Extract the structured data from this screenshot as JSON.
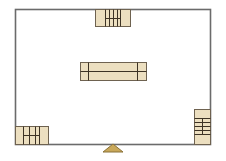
{
  "room": {
    "label": "room-outline",
    "x": 15,
    "y": 9,
    "width": 195,
    "height": 135,
    "stroke": "#6b6b6b",
    "fill": "#ffffff"
  },
  "colors": {
    "furniture_fill": "#ecdfc0",
    "furniture_stroke": "#6e6250",
    "detail_stroke": "#3d3325",
    "marker_fill": "#c9a85a",
    "marker_stroke": "#8a7238"
  },
  "furniture": [
    {
      "name": "top-shelf-unit",
      "x": 95,
      "y": 9,
      "width": 35,
      "height": 17,
      "vlines": [
        105,
        109,
        113,
        117,
        120
      ],
      "hlines": [
        {
          "y": 18,
          "x1": 105,
          "x2": 120
        }
      ]
    },
    {
      "name": "center-table",
      "x": 80,
      "y": 62,
      "width": 66,
      "height": 18,
      "vlines": [
        88,
        137
      ],
      "hlines": [
        {
          "y": 71,
          "x1": 80,
          "x2": 146
        }
      ]
    },
    {
      "name": "bottom-left-shelf-unit",
      "x": 15,
      "y": 126,
      "width": 33,
      "height": 18,
      "vlines": [
        23,
        29,
        35,
        39
      ],
      "hlines": [
        {
          "y": 135,
          "x1": 23,
          "x2": 39
        }
      ]
    },
    {
      "name": "right-shelf-unit",
      "x": 194,
      "y": 109,
      "width": 16,
      "height": 35,
      "vlines_partial": [
        {
          "x": 202,
          "y1": 118,
          "y2": 134
        }
      ],
      "hlines": [
        {
          "y": 118,
          "x1": 194,
          "x2": 210
        },
        {
          "y": 122,
          "x1": 194,
          "x2": 210
        },
        {
          "y": 126,
          "x1": 194,
          "x2": 210
        },
        {
          "y": 130,
          "x1": 194,
          "x2": 210
        },
        {
          "y": 134,
          "x1": 194,
          "x2": 210
        }
      ]
    }
  ],
  "entrance_marker": {
    "name": "entrance-marker",
    "points": [
      [
        103,
        152
      ],
      [
        113,
        144
      ],
      [
        123,
        152
      ]
    ]
  }
}
